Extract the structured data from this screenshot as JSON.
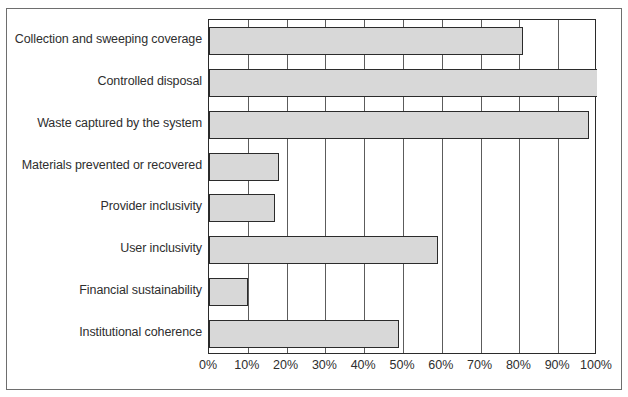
{
  "chart_data": {
    "type": "bar",
    "orientation": "horizontal",
    "title": "",
    "xlabel": "",
    "ylabel": "",
    "xlim": [
      0,
      100
    ],
    "grid": true,
    "legend": false,
    "categories": [
      "Collection and sweeping coverage",
      "Controlled disposal",
      "Waste captured by the system",
      "Materials prevented or recovered",
      "Provider inclusivity",
      "User inclusivity",
      "Financial sustainability",
      "Institutional coherence"
    ],
    "values": [
      81,
      100,
      98,
      18,
      17,
      59,
      10,
      49
    ],
    "tick_labels": [
      "0%",
      "10%",
      "20%",
      "30%",
      "40%",
      "50%",
      "60%",
      "70%",
      "80%",
      "90%",
      "100%"
    ],
    "tick_values": [
      0,
      10,
      20,
      30,
      40,
      50,
      60,
      70,
      80,
      90,
      100
    ],
    "colors": {
      "bar_fill": "#d8d8d8",
      "bar_edge": "#2b2b2b",
      "grid": "#5c5c5c",
      "text": "#2e2e2e",
      "frame": "#6e6e6e",
      "background": "#ffffff"
    }
  }
}
